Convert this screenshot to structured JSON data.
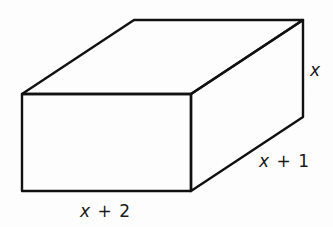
{
  "diagram": {
    "type": "rectangular-prism",
    "dimensions": {
      "height": {
        "var": "x",
        "op": "",
        "num": ""
      },
      "depth": {
        "var": "x",
        "op": "+",
        "num": "1"
      },
      "width": {
        "var": "x",
        "op": "+",
        "num": "2"
      }
    },
    "colors": {
      "stroke": "#111111",
      "background": "#fdfdfd"
    }
  }
}
